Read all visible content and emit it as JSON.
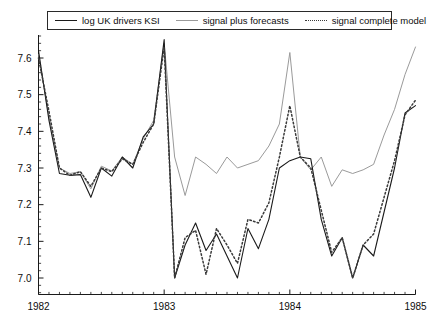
{
  "chart_data": {
    "type": "line",
    "title": "",
    "xlabel": "",
    "ylabel": "",
    "xlim": [
      1982.0,
      1985.0
    ],
    "ylim": [
      6.955,
      7.66
    ],
    "grid": false,
    "legend_position": "top",
    "y_ticks": [
      "7.0",
      "7.1",
      "7.2",
      "7.3",
      "7.4",
      "7.5",
      "7.6"
    ],
    "y_tick_values": [
      7.0,
      7.1,
      7.2,
      7.3,
      7.4,
      7.5,
      7.6
    ],
    "y_minor_ticks_per_interval": 5,
    "x_ticks": [
      "1982",
      "1983",
      "1984",
      "1985"
    ],
    "x_tick_values": [
      1982,
      1983,
      1984,
      1985
    ],
    "x_minor_tick_step_months": 1,
    "x": [
      1982.0,
      1982.0833,
      1982.1667,
      1982.25,
      1982.3333,
      1982.4167,
      1982.5,
      1982.5833,
      1982.6667,
      1982.75,
      1982.8333,
      1982.9167,
      1983.0,
      1983.0833,
      1983.1667,
      1983.25,
      1983.3333,
      1983.4167,
      1983.5,
      1983.5833,
      1983.6667,
      1983.75,
      1983.8333,
      1983.9167,
      1984.0,
      1984.0833,
      1984.1667,
      1984.25,
      1984.3333,
      1984.4167,
      1984.5,
      1984.5833,
      1984.6667,
      1984.75,
      1984.8333,
      1984.9167,
      1985.0
    ],
    "series": [
      {
        "name": "log UK drivers KSI",
        "style": "solid",
        "color": "#1a1a1a",
        "width": 1.1,
        "values": [
          7.62,
          7.43,
          7.285,
          7.28,
          7.282,
          7.22,
          7.3,
          7.278,
          7.33,
          7.3,
          7.385,
          7.42,
          7.65,
          7.0,
          7.09,
          7.15,
          7.075,
          7.12,
          7.06,
          7.0,
          7.135,
          7.08,
          7.16,
          7.3,
          7.32,
          7.33,
          7.325,
          7.16,
          7.06,
          7.11,
          7.0,
          7.09,
          7.06,
          7.18,
          7.3,
          7.45,
          7.47
        ]
      },
      {
        "name": "signal plus forecasts",
        "style": "solid",
        "color": "#9a9a9a",
        "width": 1.0,
        "values": [
          7.61,
          7.44,
          7.3,
          7.285,
          7.29,
          7.243,
          7.305,
          7.292,
          7.33,
          7.31,
          7.38,
          7.43,
          7.64,
          7.33,
          7.225,
          7.33,
          7.31,
          7.285,
          7.33,
          7.3,
          7.31,
          7.32,
          7.36,
          7.42,
          7.615,
          7.33,
          7.295,
          7.33,
          7.25,
          7.295,
          7.285,
          7.295,
          7.31,
          7.39,
          7.46,
          7.555,
          7.63
        ]
      },
      {
        "name": "signal complete model",
        "style": "dotted",
        "color": "#3a3a3a",
        "width": 1.5,
        "values": [
          7.6,
          7.455,
          7.3,
          7.28,
          7.29,
          7.25,
          7.3,
          7.29,
          7.325,
          7.31,
          7.37,
          7.42,
          7.63,
          7.0,
          7.11,
          7.13,
          7.01,
          7.135,
          7.09,
          7.04,
          7.16,
          7.15,
          7.205,
          7.33,
          7.47,
          7.33,
          7.3,
          7.185,
          7.07,
          7.11,
          7.0,
          7.09,
          7.12,
          7.22,
          7.32,
          7.445,
          7.485
        ]
      }
    ]
  },
  "legend": {
    "items": [
      {
        "label": "log UK drivers KSI",
        "style": "solid"
      },
      {
        "label": "signal plus forecasts",
        "style": "solid-gray"
      },
      {
        "label": "signal complete model",
        "style": "dotted"
      }
    ]
  },
  "colors": {
    "axis": "#1a1a1a",
    "observed": "#1a1a1a",
    "forecast": "#9a9a9a",
    "signal": "#3a3a3a",
    "background": "#ffffff"
  }
}
